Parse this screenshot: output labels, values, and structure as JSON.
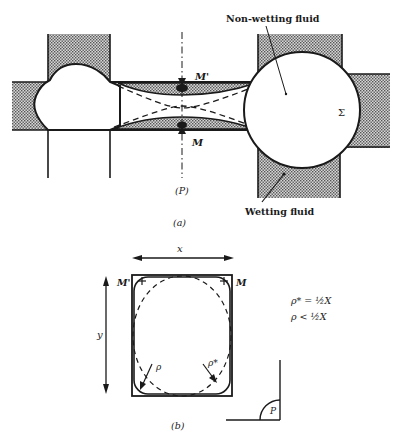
{
  "figure_a": {
    "caption": "(a)",
    "plane_label": "(P)",
    "labels": {
      "non_wetting": "Non-wetting fluid",
      "wetting": "Wetting fluid",
      "point_m_prime": "M'",
      "point_m": "M",
      "sigma": "Σ"
    }
  },
  "figure_b": {
    "caption": "(b)",
    "labels": {
      "x": "x",
      "y": "y",
      "m_prime": "M'",
      "m": "M",
      "rho": "ρ",
      "rho_star": "ρ*",
      "angle": "P"
    },
    "equations": [
      "ρ* = ½X",
      "ρ < ½X"
    ]
  },
  "colors": {
    "ink": "#1a1a1a",
    "stipple": "#9a9a9a",
    "background": "#ffffff"
  }
}
